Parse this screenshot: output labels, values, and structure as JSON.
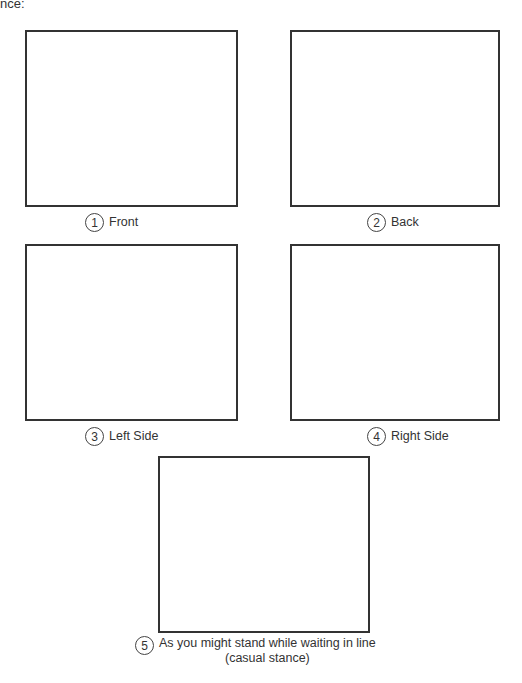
{
  "header": {
    "fragment": "nce:"
  },
  "panels": [
    {
      "number": "1",
      "label": "Front"
    },
    {
      "number": "2",
      "label": "Back"
    },
    {
      "number": "3",
      "label": "Left Side"
    },
    {
      "number": "4",
      "label": "Right Side"
    },
    {
      "number": "5",
      "label_line1": "As you might stand while waiting in line",
      "label_line2": "(casual stance)"
    }
  ]
}
